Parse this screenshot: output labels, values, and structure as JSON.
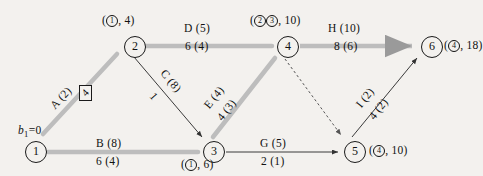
{
  "diagram": {
    "colors": {
      "highlight_edge": "#b9b9b9",
      "plain_edge": "#4a4a4a",
      "node_stroke": "#1a1a1a",
      "background": "#f3f1ee"
    },
    "nodes": [
      {
        "id": "1",
        "label": "1",
        "x": 25,
        "y": 141,
        "annotation": "b1=0",
        "annotation_pos": "above-left"
      },
      {
        "id": "2",
        "label": "2",
        "x": 124,
        "y": 36,
        "annotation": "(1, 4)",
        "annotation_pos": "above"
      },
      {
        "id": "3",
        "label": "3",
        "x": 203,
        "y": 141,
        "annotation": "(1, 6)",
        "annotation_pos": "below"
      },
      {
        "id": "4",
        "label": "4",
        "x": 277,
        "y": 36,
        "annotation": "(23, 10)",
        "annotation_pos": "above"
      },
      {
        "id": "5",
        "label": "5",
        "x": 344,
        "y": 141,
        "annotation": "(4, 10)",
        "annotation_pos": "right"
      },
      {
        "id": "6",
        "label": "6",
        "x": 421,
        "y": 36,
        "annotation": "(4, 18)",
        "annotation_pos": "right"
      }
    ],
    "edges": [
      {
        "name": "A",
        "from": "1",
        "to": "2",
        "capacity_label": "A (2)",
        "flow_label": "4",
        "style": "highlight",
        "boxed_flow": true
      },
      {
        "name": "B",
        "from": "1",
        "to": "3",
        "capacity_label": "B (8)",
        "flow_label": "6 (4)",
        "style": "highlight",
        "boxed_flow": false
      },
      {
        "name": "C",
        "from": "2",
        "to": "3",
        "capacity_label": "C (8)",
        "flow_label": "1",
        "style": "plain",
        "boxed_flow": false
      },
      {
        "name": "D",
        "from": "2",
        "to": "4",
        "capacity_label": "D (5)",
        "flow_label": "6 (4)",
        "style": "highlight",
        "boxed_flow": false
      },
      {
        "name": "E",
        "from": "3",
        "to": "4",
        "capacity_label": "E (4)",
        "flow_label": "4 (3)",
        "style": "highlight",
        "boxed_flow": false
      },
      {
        "name": "G",
        "from": "3",
        "to": "5",
        "capacity_label": "G (5)",
        "flow_label": "2 (1)",
        "style": "plain",
        "boxed_flow": false
      },
      {
        "name": "H",
        "from": "4",
        "to": "6",
        "capacity_label": "H (10)",
        "flow_label": "8 (6)",
        "style": "highlight",
        "boxed_flow": false
      },
      {
        "name": "I",
        "from": "5",
        "to": "6",
        "capacity_label": "I (2)",
        "flow_label": "4 (2)",
        "style": "plain",
        "boxed_flow": false
      },
      {
        "name": "",
        "from": "4",
        "to": "5",
        "capacity_label": "",
        "flow_label": "",
        "style": "dashed",
        "boxed_flow": false
      }
    ],
    "annotations": {
      "node1": "b",
      "node1_sub": "1",
      "node1_eq": "=0",
      "node2": "(①, 4)",
      "node3": "(①, 6)",
      "node4": "(②③, 10)",
      "node5": "(④, 10)",
      "node6": "(④, 18)"
    },
    "edge_text": {
      "A_cap": "A (2)",
      "A_flow": "4",
      "B_cap": "B (8)",
      "B_flow": "6 (4)",
      "C_cap": "C (8)",
      "C_flow": "1",
      "D_cap": "D (5)",
      "D_flow": "6 (4)",
      "E_cap": "E (4)",
      "E_flow": "4 (3)",
      "G_cap": "G (5)",
      "G_flow": "2 (1)",
      "H_cap": "H (10)",
      "H_flow": "8 (6)",
      "I_cap": "I (2)",
      "I_flow": "4 (2)"
    },
    "node_text": {
      "n1": "1",
      "n2": "2",
      "n3": "3",
      "n4": "4",
      "n5": "5",
      "n6": "6"
    }
  }
}
